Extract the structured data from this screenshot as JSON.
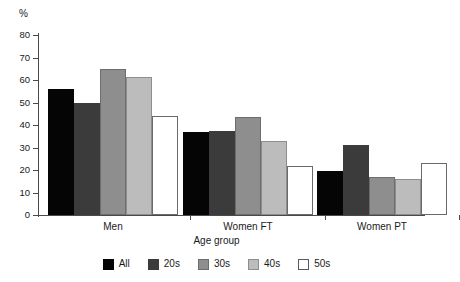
{
  "chart_data": {
    "type": "bar",
    "title": "",
    "xlabel": "Age group",
    "ylabel": "%",
    "unit_label": "%",
    "categories": [
      "Men",
      "Women FT",
      "Women PT"
    ],
    "series": [
      {
        "name": "All",
        "color": "#050505",
        "values": [
          56,
          37,
          19.5
        ]
      },
      {
        "name": "20s",
        "color": "#3b3b3b",
        "values": [
          50,
          37.5,
          31
        ]
      },
      {
        "name": "30s",
        "color": "#8e8e8e",
        "values": [
          65,
          43.5,
          17
        ]
      },
      {
        "name": "40s",
        "color": "#bcbcbc",
        "values": [
          61.5,
          33,
          16
        ]
      },
      {
        "name": "50s",
        "color": "#ffffff",
        "values": [
          44,
          22,
          23
        ]
      }
    ],
    "ylim": [
      0,
      80
    ],
    "yticks": [
      80,
      70,
      60,
      50,
      40,
      30,
      20,
      10,
      0
    ],
    "ytick_labels": [
      "80",
      "70",
      "60",
      "50",
      "40",
      "30",
      "20",
      "10",
      "0"
    ],
    "grid": false,
    "legend_position": "bottom"
  }
}
